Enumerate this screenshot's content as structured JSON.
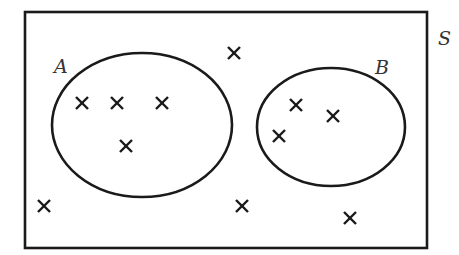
{
  "diagram": {
    "type": "venn",
    "universal_set": {
      "label": "S",
      "rect": {
        "x": 25,
        "y": 12,
        "width": 402,
        "height": 236
      },
      "label_pos": {
        "x": 438,
        "y": 45
      }
    },
    "sets": [
      {
        "label": "A",
        "center": {
          "x": 142,
          "y": 125
        },
        "rx": 90,
        "ry": 72,
        "label_pos": {
          "x": 54,
          "y": 73
        },
        "elements": [
          {
            "x": 82,
            "y": 103
          },
          {
            "x": 117,
            "y": 103
          },
          {
            "x": 162,
            "y": 103
          },
          {
            "x": 126,
            "y": 146
          }
        ]
      },
      {
        "label": "B",
        "center": {
          "x": 331,
          "y": 127
        },
        "rx": 74,
        "ry": 59,
        "label_pos": {
          "x": 375,
          "y": 74
        },
        "elements": [
          {
            "x": 296,
            "y": 105
          },
          {
            "x": 333,
            "y": 116
          },
          {
            "x": 279,
            "y": 136
          }
        ]
      }
    ],
    "outside_elements": [
      {
        "x": 234,
        "y": 53
      },
      {
        "x": 44,
        "y": 206
      },
      {
        "x": 242,
        "y": 206
      },
      {
        "x": 350,
        "y": 218
      }
    ],
    "counts": {
      "A_only": 4,
      "B_only": 3,
      "A_and_B": 0,
      "neither": 4,
      "total": 11
    },
    "marker_symbol": "×"
  }
}
